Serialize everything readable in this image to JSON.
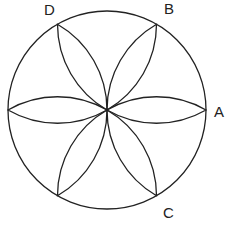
{
  "diagram": {
    "circle": {
      "cx": 107,
      "cy": 110,
      "r": 99
    },
    "stroke_color": "#222222",
    "labels": [
      {
        "id": "A",
        "text": "A",
        "x": 214,
        "y": 117
      },
      {
        "id": "B",
        "text": "B",
        "x": 164,
        "y": 14
      },
      {
        "id": "C",
        "text": "C",
        "x": 163,
        "y": 218
      },
      {
        "id": "D",
        "text": "D",
        "x": 44,
        "y": 15
      }
    ],
    "petal_angles_deg": [
      0,
      60,
      120,
      180,
      240,
      300
    ]
  }
}
